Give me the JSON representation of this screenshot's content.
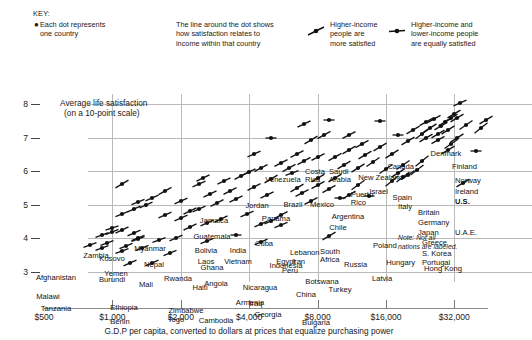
{
  "key": {
    "title": "KEY:",
    "items": [
      {
        "name": "dot-meaning",
        "glyph": "dot",
        "lines": [
          "Each dot represents",
          "one country"
        ]
      },
      {
        "name": "line-meaning",
        "glyph": "none",
        "lines": [
          "The line around the dot shows",
          "how satisfaction relates to",
          "income within that country"
        ]
      },
      {
        "name": "steep-slope-meaning",
        "glyph": "slope-up",
        "lines": [
          "Higher-income",
          "people are",
          "more satisfied"
        ]
      },
      {
        "name": "flat-slope-meaning",
        "glyph": "slope-flat",
        "lines": [
          "Higher-income and",
          "lower-income people",
          "are equally satisfied"
        ]
      }
    ]
  },
  "note": {
    "line1": "Note: Not all",
    "line2": "nations are labeled."
  },
  "chart_data": {
    "type": "scatter",
    "title": "",
    "xlabel": "G.D.P per capita, converted to dollars at prices that equalize purchasing power",
    "ylabel_line1": "Average life satisfaction",
    "ylabel_line2": "(on a 10-point scale)",
    "xscale": "log2",
    "xlim": [
      500,
      45000
    ],
    "ylim": [
      2.7,
      8.3
    ],
    "grid": true,
    "legend_position": "top",
    "xticks": [
      {
        "value": 500,
        "label": "$500"
      },
      {
        "value": 1000,
        "label": "$1,000"
      },
      {
        "value": 2000,
        "label": "$2,000"
      },
      {
        "value": 4000,
        "label": "$4,000"
      },
      {
        "value": 8000,
        "label": "$8,000"
      },
      {
        "value": 16000,
        "label": "$16,000"
      },
      {
        "value": 32000,
        "label": "$32,000"
      }
    ],
    "yticks": [
      {
        "value": 8,
        "label": "8"
      },
      {
        "value": 7,
        "label": "7"
      },
      {
        "value": 6,
        "label": "6"
      },
      {
        "value": 5,
        "label": "5"
      },
      {
        "value": 4,
        "label": "4"
      },
      {
        "value": 3,
        "label": "3"
      }
    ],
    "points": [
      {
        "label": "Denmark",
        "x": 34000,
        "y": 8.02,
        "slope": 0.22,
        "lx": 446,
        "ly": 88,
        "align": "ctr"
      },
      {
        "label": "Finland",
        "x": 32000,
        "y": 7.7,
        "slope": 0.3,
        "lx": 452,
        "ly": 101,
        "align": "left"
      },
      {
        "label": "Canada",
        "x": 33000,
        "y": 7.6,
        "slope": 0.3,
        "lx": 414,
        "ly": 101,
        "align": "rt"
      },
      {
        "label": "Norway",
        "x": 44000,
        "y": 7.52,
        "slope": 0.3,
        "lx": 455,
        "ly": 115,
        "align": "left"
      },
      {
        "label": "Ireland",
        "x": 36000,
        "y": 7.38,
        "slope": 0.34,
        "lx": 455,
        "ly": 126,
        "align": "left"
      },
      {
        "label": "U.S.",
        "x": 42000,
        "y": 7.28,
        "slope": 0.4,
        "lx": 455,
        "ly": 136,
        "align": "left",
        "bold": true
      },
      {
        "label": "New Zealand",
        "x": 24000,
        "y": 7.48,
        "slope": 0.28,
        "lx": 403,
        "ly": 112,
        "align": "rt"
      },
      {
        "label": "Israel",
        "x": 23000,
        "y": 7.12,
        "slope": 0.36,
        "lx": 388,
        "ly": 126,
        "align": "rt"
      },
      {
        "label": "Spain",
        "x": 27000,
        "y": 7.1,
        "slope": 0.3,
        "lx": 412,
        "ly": 132,
        "align": "rt"
      },
      {
        "label": "Italy",
        "x": 27000,
        "y": 6.92,
        "slope": 0.28,
        "lx": 412,
        "ly": 141,
        "align": "rt"
      },
      {
        "label": "Britain",
        "x": 33000,
        "y": 7.0,
        "slope": 0.32,
        "lx": 418,
        "ly": 147,
        "align": "left"
      },
      {
        "label": "Germany",
        "x": 31000,
        "y": 6.82,
        "slope": 0.34,
        "lx": 418,
        "ly": 157,
        "align": "left"
      },
      {
        "label": "Japan",
        "x": 30000,
        "y": 6.62,
        "slope": 0.3,
        "lx": 418,
        "ly": 167,
        "align": "left"
      },
      {
        "label": "U.A.E.",
        "x": 40000,
        "y": 6.6,
        "slope": 0.0,
        "lx": 455,
        "ly": 167,
        "align": "left"
      },
      {
        "label": "Greece",
        "x": 23000,
        "y": 6.3,
        "slope": 0.4,
        "lx": 422,
        "ly": 177,
        "align": "left"
      },
      {
        "label": "S. Korea",
        "x": 22000,
        "y": 6.05,
        "slope": 0.38,
        "lx": 422,
        "ly": 188,
        "align": "left"
      },
      {
        "label": "Portugal",
        "x": 19000,
        "y": 5.82,
        "slope": 0.38,
        "lx": 422,
        "ly": 197,
        "align": "left"
      },
      {
        "label": "Hong Kong",
        "x": 35000,
        "y": 5.64,
        "slope": 0.3,
        "lx": 424,
        "ly": 203,
        "align": "left"
      },
      {
        "label": "Poland",
        "x": 14000,
        "y": 6.28,
        "slope": 0.34,
        "lx": 373,
        "ly": 180,
        "align": "left"
      },
      {
        "label": "Hungary",
        "x": 17000,
        "y": 5.7,
        "slope": 0.4,
        "lx": 415,
        "ly": 197,
        "align": "rt"
      },
      {
        "label": "Latvia",
        "x": 13500,
        "y": 5.26,
        "slope": 0.0,
        "lx": 372,
        "ly": 213,
        "align": "left"
      },
      {
        "label": "Russia",
        "x": 12000,
        "y": 5.58,
        "slope": 0.36,
        "lx": 344,
        "ly": 199,
        "align": "left"
      },
      {
        "label": "Botswana",
        "x": 10000,
        "y": 5.2,
        "slope": 0.0,
        "lx": 322,
        "ly": 216,
        "align": "ctr"
      },
      {
        "label": "South Africa",
        "x": 9500,
        "y": 5.8,
        "slope": 0.3,
        "lx": 330,
        "ly": 186,
        "align": "ctr",
        "two": true
      },
      {
        "label": "Chile",
        "x": 11000,
        "y": 6.62,
        "slope": 0.3,
        "lx": 338,
        "ly": 162,
        "align": "ctr"
      },
      {
        "label": "Argentina",
        "x": 12500,
        "y": 6.82,
        "slope": 0.28,
        "lx": 348,
        "ly": 151,
        "align": "ctr"
      },
      {
        "label": "Puerto Rico",
        "x": 18000,
        "y": 7.08,
        "slope": 0.0,
        "lx": 362,
        "ly": 129,
        "align": "ctr",
        "two": true
      },
      {
        "label": "Saudi Arabia",
        "x": 15000,
        "y": 7.5,
        "slope": 0.0,
        "lx": 340,
        "ly": 106,
        "align": "ctr",
        "two": true
      },
      {
        "label": "Costa Rica",
        "x": 9000,
        "y": 7.52,
        "slope": 0.0,
        "lx": 315,
        "ly": 106,
        "align": "ctr",
        "two": true
      },
      {
        "label": "Venezuela",
        "x": 7000,
        "y": 7.42,
        "slope": 0.24,
        "lx": 283,
        "ly": 114,
        "align": "ctr"
      },
      {
        "label": "Brazil",
        "x": 8500,
        "y": 7.08,
        "slope": 0.28,
        "lx": 293,
        "ly": 139,
        "align": "ctr"
      },
      {
        "label": "Mexico",
        "x": 11000,
        "y": 7.08,
        "slope": 0.26,
        "lx": 322,
        "ly": 139,
        "align": "ctr"
      },
      {
        "label": "Panama",
        "x": 7500,
        "y": 6.92,
        "slope": 0.3,
        "lx": 276,
        "ly": 153,
        "align": "ctr"
      },
      {
        "label": "Jordan",
        "x": 5000,
        "y": 7.0,
        "slope": 0.0,
        "lx": 257,
        "ly": 140,
        "align": "ctr"
      },
      {
        "label": "Jamaica",
        "x": 4200,
        "y": 6.5,
        "slope": 0.22,
        "lx": 214,
        "ly": 155,
        "align": "ctr"
      },
      {
        "label": "Guatemala",
        "x": 4500,
        "y": 6.1,
        "slope": 0.26,
        "lx": 212,
        "ly": 171,
        "align": "ctr"
      },
      {
        "label": "Cuba",
        "x": 6200,
        "y": 5.95,
        "slope": 0.18,
        "lx": 264,
        "ly": 178,
        "align": "ctr"
      },
      {
        "label": "Lebanon",
        "x": 8000,
        "y": 5.8,
        "slope": 0.3,
        "lx": 290,
        "ly": 187,
        "align": "left"
      },
      {
        "label": "Egypt",
        "x": 5000,
        "y": 5.78,
        "slope": 0.3,
        "lx": 286,
        "ly": 196,
        "align": "ctr"
      },
      {
        "label": "Iran",
        "x": 8000,
        "y": 5.6,
        "slope": 0.28,
        "lx": 292,
        "ly": 196,
        "align": "left"
      },
      {
        "label": "Peru",
        "x": 6500,
        "y": 5.5,
        "slope": 0.3,
        "lx": 282,
        "ly": 205,
        "align": "left"
      },
      {
        "label": "Bolivia",
        "x": 3700,
        "y": 5.86,
        "slope": 0.26,
        "lx": 206,
        "ly": 185,
        "align": "ctr"
      },
      {
        "label": "India",
        "x": 2500,
        "y": 5.8,
        "slope": 0.24,
        "lx": 238,
        "ly": 185,
        "align": "ctr"
      },
      {
        "label": "Vietnam",
        "x": 2400,
        "y": 5.62,
        "slope": 0.22,
        "lx": 238,
        "ly": 196,
        "align": "ctr"
      },
      {
        "label": "Indonesia",
        "x": 3300,
        "y": 5.42,
        "slope": 0.26,
        "lx": 286,
        "ly": 200,
        "align": "ctr"
      },
      {
        "label": "Myanmar",
        "x": 1100,
        "y": 5.62,
        "slope": 0.3,
        "lx": 150,
        "ly": 183,
        "align": "ctr"
      },
      {
        "label": "Kosovo",
        "x": 1700,
        "y": 5.42,
        "slope": 0.28,
        "lx": 112,
        "ly": 193,
        "align": "ctr"
      },
      {
        "label": "Zambia",
        "x": 1300,
        "y": 5.08,
        "slope": 0.2,
        "lx": 96,
        "ly": 190,
        "align": "ctr"
      },
      {
        "label": "Yemen",
        "x": 2200,
        "y": 4.82,
        "slope": 0.24,
        "lx": 116,
        "ly": 208,
        "align": "ctr"
      },
      {
        "label": "Nepal",
        "x": 1100,
        "y": 4.72,
        "slope": 0.2,
        "lx": 154,
        "ly": 199,
        "align": "ctr"
      },
      {
        "label": "Laos",
        "x": 2000,
        "y": 5.1,
        "slope": 0.22,
        "lx": 206,
        "ly": 196,
        "align": "ctr"
      },
      {
        "label": "Ghana",
        "x": 1400,
        "y": 5.0,
        "slope": 0.22,
        "lx": 212,
        "ly": 202,
        "align": "ctr"
      },
      {
        "label": "Afghanistan",
        "x": 1000,
        "y": 4.32,
        "slope": 0.16,
        "lx": 56,
        "ly": 212,
        "align": "ctr"
      },
      {
        "label": "Burundi",
        "x": 1000,
        "y": 4.18,
        "slope": 0.2,
        "lx": 112,
        "ly": 214,
        "align": "ctr"
      },
      {
        "label": "Mali",
        "x": 1300,
        "y": 4.02,
        "slope": 0.2,
        "lx": 146,
        "ly": 219,
        "align": "ctr"
      },
      {
        "label": "Rwanda",
        "x": 1100,
        "y": 4.24,
        "slope": 0.24,
        "lx": 178,
        "ly": 213,
        "align": "ctr"
      },
      {
        "label": "Haiti",
        "x": 1300,
        "y": 3.98,
        "slope": 0.18,
        "lx": 200,
        "ly": 222,
        "align": "ctr"
      },
      {
        "label": "Angola",
        "x": 5000,
        "y": 4.52,
        "slope": 0.22,
        "lx": 216,
        "ly": 218,
        "align": "ctr"
      },
      {
        "label": "Nicaragua",
        "x": 3000,
        "y": 4.58,
        "slope": 0.24,
        "lx": 260,
        "ly": 222,
        "align": "ctr"
      },
      {
        "label": "Armenia",
        "x": 5500,
        "y": 4.4,
        "slope": 0.2,
        "lx": 250,
        "ly": 237,
        "align": "ctr"
      },
      {
        "label": "China",
        "x": 5500,
        "y": 4.7,
        "slope": 0.26,
        "lx": 306,
        "ly": 229,
        "align": "ctr"
      },
      {
        "label": "Turkey",
        "x": 11000,
        "y": 5.3,
        "slope": 0.3,
        "lx": 340,
        "ly": 224,
        "align": "ctr"
      },
      {
        "label": "Malawi",
        "x": 800,
        "y": 3.8,
        "slope": 0.18,
        "lx": 48,
        "ly": 231,
        "align": "ctr"
      },
      {
        "label": "Tanzania",
        "x": 1100,
        "y": 3.62,
        "slope": 0.18,
        "lx": 56,
        "ly": 243,
        "align": "ctr"
      },
      {
        "label": "Ethiopia",
        "x": 900,
        "y": 3.7,
        "slope": 0.18,
        "lx": 124,
        "ly": 242,
        "align": "ctr"
      },
      {
        "label": "Zimbabwe",
        "x": 1800,
        "y": 3.56,
        "slope": 0.2,
        "lx": 186,
        "ly": 245,
        "align": "ctr"
      },
      {
        "label": "Iraq",
        "x": 3500,
        "y": 4.1,
        "slope": 0.0,
        "lx": 256,
        "ly": 238,
        "align": "ctr"
      },
      {
        "label": "Georgia",
        "x": 4500,
        "y": 3.9,
        "slope": 0.22,
        "lx": 268,
        "ly": 249,
        "align": "ctr"
      },
      {
        "label": "Benin",
        "x": 1200,
        "y": 3.28,
        "slope": 0.22,
        "lx": 120,
        "ly": 256,
        "align": "ctr"
      },
      {
        "label": "Togo",
        "x": 1500,
        "y": 3.26,
        "slope": 0.22,
        "lx": 176,
        "ly": 254,
        "align": "ctr"
      },
      {
        "label": "Cambodia",
        "x": 2600,
        "y": 3.92,
        "slope": 0.2,
        "lx": 216,
        "ly": 255,
        "align": "ctr"
      },
      {
        "label": "Bulgaria",
        "x": 9000,
        "y": 4.08,
        "slope": 0.3,
        "lx": 316,
        "ly": 257,
        "align": "ctr"
      }
    ],
    "unlabeled_points": [
      {
        "x": 900,
        "y": 4.1,
        "slope": 0.18
      },
      {
        "x": 1250,
        "y": 4.16,
        "slope": 0.22
      },
      {
        "x": 950,
        "y": 3.86,
        "slope": 0.18
      },
      {
        "x": 1150,
        "y": 3.78,
        "slope": 0.2
      },
      {
        "x": 1350,
        "y": 3.7,
        "slope": 0.2
      },
      {
        "x": 1600,
        "y": 3.94,
        "slope": 0.18
      },
      {
        "x": 1900,
        "y": 4.0,
        "slope": 0.22
      },
      {
        "x": 2200,
        "y": 4.34,
        "slope": 0.24
      },
      {
        "x": 2600,
        "y": 4.46,
        "slope": 0.22
      },
      {
        "x": 2900,
        "y": 5.04,
        "slope": 0.26
      },
      {
        "x": 1700,
        "y": 4.7,
        "slope": 0.22
      },
      {
        "x": 2000,
        "y": 4.6,
        "slope": 0.22
      },
      {
        "x": 3500,
        "y": 5.18,
        "slope": 0.24
      },
      {
        "x": 4200,
        "y": 5.52,
        "slope": 0.26
      },
      {
        "x": 4800,
        "y": 5.28,
        "slope": 0.24
      },
      {
        "x": 6000,
        "y": 6.1,
        "slope": 0.28
      },
      {
        "x": 7000,
        "y": 6.3,
        "slope": 0.28
      },
      {
        "x": 6500,
        "y": 6.52,
        "slope": 0.26
      },
      {
        "x": 9500,
        "y": 6.42,
        "slope": 0.28
      },
      {
        "x": 13000,
        "y": 6.48,
        "slope": 0.3
      },
      {
        "x": 15000,
        "y": 6.72,
        "slope": 0.3
      },
      {
        "x": 17000,
        "y": 6.5,
        "slope": 0.32
      },
      {
        "x": 20000,
        "y": 6.9,
        "slope": 0.3
      },
      {
        "x": 21000,
        "y": 7.24,
        "slope": 0.3
      },
      {
        "x": 25000,
        "y": 7.28,
        "slope": 0.32
      },
      {
        "x": 28000,
        "y": 7.34,
        "slope": 0.3
      },
      {
        "x": 29000,
        "y": 7.46,
        "slope": 0.3
      },
      {
        "x": 26000,
        "y": 7.56,
        "slope": 0.28
      },
      {
        "x": 31000,
        "y": 7.58,
        "slope": 0.3
      },
      {
        "x": 30000,
        "y": 7.22,
        "slope": 0.32
      },
      {
        "x": 24000,
        "y": 6.98,
        "slope": 0.3
      },
      {
        "x": 19000,
        "y": 6.2,
        "slope": 0.34
      },
      {
        "x": 16000,
        "y": 6.08,
        "slope": 0.34
      },
      {
        "x": 12000,
        "y": 6.1,
        "slope": 0.32
      },
      {
        "x": 10500,
        "y": 6.18,
        "slope": 0.3
      },
      {
        "x": 8000,
        "y": 6.42,
        "slope": 0.26
      },
      {
        "x": 5500,
        "y": 6.24,
        "slope": 0.26
      },
      {
        "x": 4000,
        "y": 5.98,
        "slope": 0.24
      },
      {
        "x": 3100,
        "y": 5.7,
        "slope": 0.24
      },
      {
        "x": 2700,
        "y": 5.32,
        "slope": 0.24
      },
      {
        "x": 1500,
        "y": 5.2,
        "slope": 0.22
      },
      {
        "x": 1250,
        "y": 4.88,
        "slope": 0.22
      },
      {
        "x": 2400,
        "y": 4.88,
        "slope": 0.22
      },
      {
        "x": 3900,
        "y": 4.74,
        "slope": 0.22
      },
      {
        "x": 4500,
        "y": 4.44,
        "slope": 0.22
      },
      {
        "x": 7500,
        "y": 5.1,
        "slope": 0.26
      },
      {
        "x": 6800,
        "y": 5.36,
        "slope": 0.26
      },
      {
        "x": 9000,
        "y": 5.48,
        "slope": 0.28
      },
      {
        "x": 20000,
        "y": 5.9,
        "slope": 0.34
      },
      {
        "x": 18000,
        "y": 5.96,
        "slope": 0.32
      }
    ]
  }
}
